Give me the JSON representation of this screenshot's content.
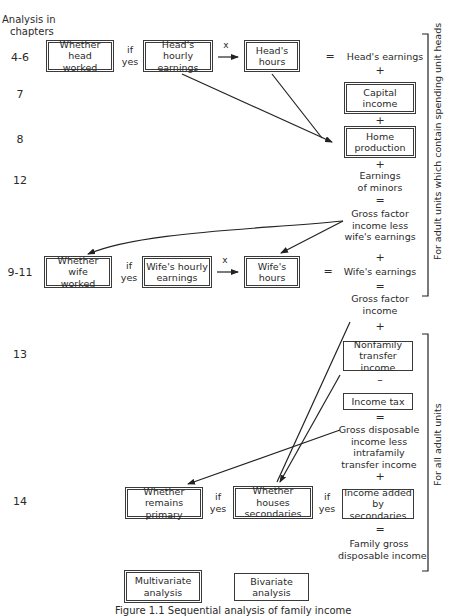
{
  "header": {
    "chapters_label_line1": "Analysis in",
    "chapters_label_line2": "chapters"
  },
  "chapters": {
    "c1": "4-6",
    "c2": "7",
    "c3": "8",
    "c4": "12",
    "c5": "9-11",
    "c6": "13",
    "c7": "14"
  },
  "row_head": {
    "whether_worked": [
      "Whether head",
      "worked"
    ],
    "if_yes": [
      "if",
      "yes"
    ],
    "hourly_earnings": [
      "Head's hourly",
      "earnings"
    ],
    "times": "x",
    "hours": [
      "Head's",
      "hours"
    ],
    "equals": "=",
    "result": "Head's earnings"
  },
  "column_upper": {
    "plus1": "+",
    "capital_income": [
      "Capital",
      "income"
    ],
    "plus2": "+",
    "home_production": [
      "Home",
      "production"
    ],
    "plus3": "+",
    "earnings_of_minors": [
      "Earnings",
      "of minors"
    ],
    "equals1": "=",
    "gross_factor_less_wife": [
      "Gross factor",
      "income less",
      "wife's earnings"
    ],
    "plus4": "+",
    "wifes_earnings": "Wife's earnings",
    "equals2": "=",
    "gross_factor_income": [
      "Gross factor",
      "income"
    ]
  },
  "row_wife": {
    "whether_worked": [
      "Whether wife",
      "worked"
    ],
    "if_yes": [
      "if",
      "yes"
    ],
    "hourly_earnings": [
      "Wife's hourly",
      "earnings"
    ],
    "times": "x",
    "hours": [
      "Wife's",
      "hours"
    ],
    "equals": "="
  },
  "column_lower": {
    "plus": "+",
    "nonfamily_transfer": [
      "Nonfamily",
      "transfer income"
    ],
    "minus": "–",
    "income_tax": "Income tax",
    "equals1": "=",
    "gross_disposable_less": [
      "Gross disposable",
      "income less",
      "intrafamily",
      "transfer income"
    ],
    "plus2": "+",
    "income_added_secondaries": [
      "Income added",
      "by secondaries"
    ],
    "equals2": "=",
    "family_gross_disposable": [
      "Family gross",
      "disposable income"
    ]
  },
  "row_secondaries": {
    "whether_remains_primary": [
      "Whether remains",
      "primary"
    ],
    "if_yes1": [
      "if",
      "yes"
    ],
    "whether_houses_secondaries": [
      "Whether houses",
      "secondaries"
    ],
    "if_yes2": [
      "if",
      "yes"
    ]
  },
  "legend": {
    "multivariate": [
      "Multivariate",
      "analysis"
    ],
    "bivariate": [
      "Bivariate",
      "analysis"
    ]
  },
  "brackets": {
    "upper": "For adult units which contain spending unit heads",
    "lower": "For all adult units"
  },
  "caption": "Figure 1.1 Sequential analysis of family income"
}
